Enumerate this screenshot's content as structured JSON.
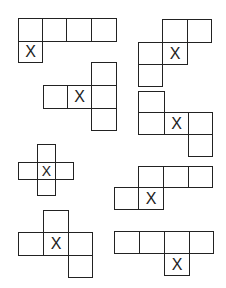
{
  "diagram": {
    "mark": "X",
    "nets": [
      {
        "id": 1,
        "cells": [
          {
            "x": 18,
            "y": 18,
            "w": 25,
            "h": 24
          },
          {
            "x": 42,
            "y": 18,
            "w": 25,
            "h": 24
          },
          {
            "x": 66,
            "y": 18,
            "w": 26,
            "h": 24
          },
          {
            "x": 91,
            "y": 18,
            "w": 26,
            "h": 24
          },
          {
            "x": 18,
            "y": 41,
            "w": 25,
            "h": 22,
            "mark": "X"
          }
        ]
      },
      {
        "id": 2,
        "cells": [
          {
            "x": 162,
            "y": 19,
            "w": 26,
            "h": 24
          },
          {
            "x": 187,
            "y": 19,
            "w": 25,
            "h": 24
          },
          {
            "x": 138,
            "y": 42,
            "w": 25,
            "h": 23
          },
          {
            "x": 162,
            "y": 42,
            "w": 26,
            "h": 23,
            "mark": "X"
          },
          {
            "x": 138,
            "y": 64,
            "w": 25,
            "h": 23
          }
        ]
      },
      {
        "id": 3,
        "cells": [
          {
            "x": 91,
            "y": 62,
            "w": 26,
            "h": 24
          },
          {
            "x": 43,
            "y": 85,
            "w": 25,
            "h": 24
          },
          {
            "x": 67,
            "y": 85,
            "w": 25,
            "h": 24,
            "mark": "X"
          },
          {
            "x": 91,
            "y": 85,
            "w": 26,
            "h": 24
          },
          {
            "x": 91,
            "y": 108,
            "w": 26,
            "h": 23
          }
        ]
      },
      {
        "id": 4,
        "cells": [
          {
            "x": 138,
            "y": 91,
            "w": 27,
            "h": 22
          },
          {
            "x": 138,
            "y": 112,
            "w": 27,
            "h": 23
          },
          {
            "x": 164,
            "y": 112,
            "w": 25,
            "h": 23,
            "mark": "X"
          },
          {
            "x": 188,
            "y": 112,
            "w": 25,
            "h": 23
          },
          {
            "x": 188,
            "y": 134,
            "w": 25,
            "h": 23
          }
        ]
      },
      {
        "id": 5,
        "small": true,
        "cells": [
          {
            "x": 37,
            "y": 144,
            "w": 19,
            "h": 19
          },
          {
            "x": 18,
            "y": 162,
            "w": 20,
            "h": 18
          },
          {
            "x": 37,
            "y": 162,
            "w": 19,
            "h": 18,
            "mark": "X"
          },
          {
            "x": 55,
            "y": 162,
            "w": 19,
            "h": 18
          },
          {
            "x": 37,
            "y": 179,
            "w": 19,
            "h": 17
          }
        ]
      },
      {
        "id": 6,
        "cells": [
          {
            "x": 138,
            "y": 166,
            "w": 26,
            "h": 22
          },
          {
            "x": 163,
            "y": 166,
            "w": 26,
            "h": 22
          },
          {
            "x": 188,
            "y": 166,
            "w": 25,
            "h": 22
          },
          {
            "x": 114,
            "y": 187,
            "w": 25,
            "h": 23
          },
          {
            "x": 138,
            "y": 187,
            "w": 26,
            "h": 23,
            "mark": "X"
          }
        ]
      },
      {
        "id": 7,
        "cells": [
          {
            "x": 43,
            "y": 210,
            "w": 26,
            "h": 23
          },
          {
            "x": 18,
            "y": 232,
            "w": 26,
            "h": 24
          },
          {
            "x": 43,
            "y": 232,
            "w": 26,
            "h": 24,
            "mark": "X"
          },
          {
            "x": 68,
            "y": 232,
            "w": 25,
            "h": 24
          },
          {
            "x": 68,
            "y": 255,
            "w": 25,
            "h": 23
          }
        ]
      },
      {
        "id": 8,
        "cells": [
          {
            "x": 114,
            "y": 231,
            "w": 26,
            "h": 23
          },
          {
            "x": 139,
            "y": 231,
            "w": 26,
            "h": 23
          },
          {
            "x": 164,
            "y": 231,
            "w": 26,
            "h": 23
          },
          {
            "x": 189,
            "y": 231,
            "w": 25,
            "h": 23
          },
          {
            "x": 164,
            "y": 253,
            "w": 26,
            "h": 23,
            "mark": "X"
          }
        ]
      }
    ]
  }
}
